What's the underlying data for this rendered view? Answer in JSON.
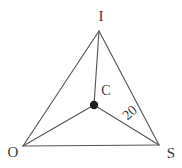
{
  "figure": {
    "labels": {
      "top_vertex": "I",
      "left_vertex": "O",
      "right_vertex": "S",
      "center_point": "C",
      "segment_length": "20"
    },
    "colors": {
      "line": "#585858",
      "text": "#3a3a3a",
      "dot": "#1f1f1f",
      "background": "#ffffff"
    }
  }
}
